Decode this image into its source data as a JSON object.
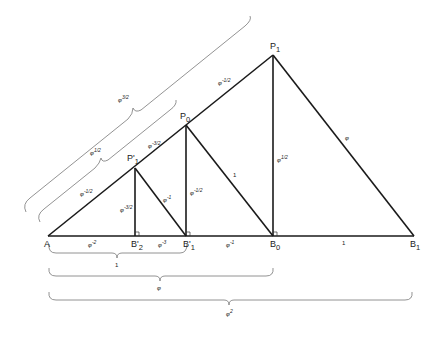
{
  "diagram": {
    "type": "golden-ratio right-triangle nesting",
    "points": {
      "A": "A",
      "B2p": "B'",
      "B2p_sub": "2",
      "B1p": "B'",
      "B1p_sub": "1",
      "B0": "B",
      "B0_sub": "0",
      "B1": "B",
      "B1_sub": "1",
      "P1p": "P'",
      "P1p_sub": "1",
      "P0": "P",
      "P0_sub": "0",
      "P1": "P",
      "P1_sub": "1"
    },
    "segment_labels": {
      "A_B2p": "φ",
      "A_B2p_exp": "-2",
      "B2p_B1p": "φ",
      "B2p_B1p_exp": "-3",
      "B1p_B0": "φ",
      "B1p_B0_exp": "-1",
      "B0_B1": "1",
      "A_P1p": "φ",
      "A_P1p_exp": "-1/2",
      "P1p_P0": "φ",
      "P1p_P0_exp": "-3/2",
      "P0_P1": "φ",
      "P0_P1_exp": "-1/2",
      "P1p_B2p": "φ",
      "P1p_B2p_exp": "-3/2",
      "P1p_B1p": "φ",
      "P1p_B1p_exp": "-1",
      "P0_B1p": "φ",
      "P0_B1p_exp": "-1/2",
      "P0_B0": "1",
      "P1_B0": "φ",
      "P1_B0_exp": "1/2",
      "P1_B1": "φ"
    },
    "brace_labels": {
      "hyp_inner": "φ",
      "hyp_inner_exp": "1/2",
      "hyp_outer": "φ",
      "hyp_outer_exp": "3/2",
      "base_1": "1",
      "base_2": "φ",
      "base_3": "φ",
      "base_3_exp": "2"
    }
  }
}
